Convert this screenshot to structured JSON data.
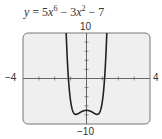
{
  "chart_data": {
    "type": "line",
    "function": "5x^6 - 3x^2 - 7",
    "xlim": [
      -4,
      4
    ],
    "ylim": [
      -10,
      10
    ],
    "x_tick_interval": 1,
    "y_tick_interval": 2,
    "grid": false,
    "labels": {
      "xmin": "−4",
      "xmax": "4",
      "ymin": "−10",
      "ymax": "10"
    },
    "key_points": [
      {
        "x": -1.28,
        "y": 10
      },
      {
        "x": -0.67,
        "y": -7.89
      },
      {
        "x": 0,
        "y": -7
      },
      {
        "x": 0.67,
        "y": -7.89
      },
      {
        "x": 1.28,
        "y": 10
      }
    ]
  },
  "equation": {
    "lhs": "y",
    "eq": "=",
    "c1": "5",
    "v1": "x",
    "e1": "6",
    "op1": "−",
    "c2": "3",
    "v2": "x",
    "e2": "2",
    "op2": "−",
    "c3": "7"
  },
  "colors": {
    "frame_bg": "#efefef",
    "frame_border": "#777777",
    "curve": "#222222",
    "axis": "#666666"
  }
}
